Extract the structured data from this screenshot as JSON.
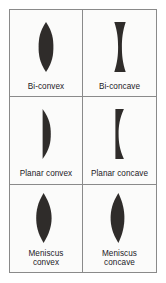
{
  "figure": {
    "background_color": "#fbfbfa",
    "border_color": "#8a8a8a",
    "lens_fill_color": "#2f2c2a",
    "caption_color": "#23211f",
    "columns": 2,
    "rows": 3
  },
  "cells": [
    {
      "id": "bi-convex",
      "icon": "bi-convex-lens-icon",
      "label_lines": [
        "Bi-convex"
      ],
      "label": "Bi-convex"
    },
    {
      "id": "bi-concave",
      "icon": "bi-concave-lens-icon",
      "label_lines": [
        "Bi-concave"
      ],
      "label": "Bi-concave"
    },
    {
      "id": "planar-convex",
      "icon": "planar-convex-lens-icon",
      "label_lines": [
        "Planar convex"
      ],
      "label": "Planar convex"
    },
    {
      "id": "planar-concave",
      "icon": "planar-concave-lens-icon",
      "label_lines": [
        "Planar concave"
      ],
      "label": "Planar concave"
    },
    {
      "id": "meniscus-convex",
      "icon": "meniscus-convex-lens-icon",
      "label_lines": [
        "Meniscus",
        "convex"
      ],
      "label": "Meniscus convex"
    },
    {
      "id": "meniscus-concave",
      "icon": "meniscus-concave-lens-icon",
      "label_lines": [
        "Meniscus",
        "concave"
      ],
      "label": "Meniscus concave"
    }
  ]
}
